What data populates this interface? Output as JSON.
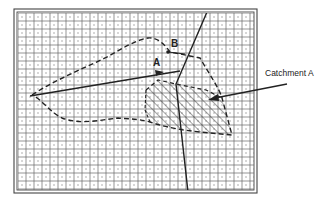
{
  "diagram": {
    "labels": {
      "point_a": "A",
      "point_b": "B",
      "catchment_callout": "Catchment A"
    },
    "frame": {
      "x": 14,
      "y": 9,
      "width": 243,
      "height": 184
    },
    "grid": {
      "x": 18,
      "y": 13,
      "width": 236,
      "height": 177,
      "cell": 8
    },
    "colors": {
      "ink": "#2a2a2a",
      "grid": "#555555",
      "background": "#ffffff"
    },
    "elements": [
      {
        "type": "dashed-boundary",
        "name": "outer catchment boundary"
      },
      {
        "type": "hatched-region",
        "name": "Catchment A"
      },
      {
        "type": "solid-line",
        "name": "flow line to A"
      },
      {
        "type": "solid-line",
        "name": "long straight line crossing map"
      },
      {
        "type": "leader-arrow",
        "name": "callout pointer to Catchment A"
      }
    ]
  }
}
